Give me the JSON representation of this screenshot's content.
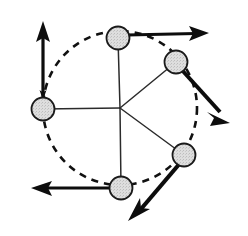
{
  "figure": {
    "type": "diagram",
    "canvas": {
      "width": 248,
      "height": 236,
      "background": "#ffffff"
    },
    "colors": {
      "stroke": "#1a1a1a",
      "spoke": "#2b2b2b",
      "node_fill": "#d9d9d9",
      "node_stroke": "#1a1a1a",
      "dashed_path": "#111111",
      "arrow": "#0d0d0d"
    },
    "center": {
      "label": "center-hub",
      "x": 120,
      "y": 108
    },
    "orbit": {
      "label": "dashed-circular-path",
      "cx": 120,
      "cy": 108,
      "r": 77,
      "dash": "7 6",
      "stroke_width": 2.6
    },
    "nodes": [
      {
        "name": "node-top",
        "x": 118,
        "y": 38,
        "r": 11.5
      },
      {
        "name": "node-upper-right",
        "x": 176,
        "y": 62,
        "r": 11.5
      },
      {
        "name": "node-lower-right",
        "x": 184,
        "y": 155,
        "r": 11.5
      },
      {
        "name": "node-bottom",
        "x": 121,
        "y": 188,
        "r": 11.5
      },
      {
        "name": "node-left",
        "x": 43,
        "y": 109,
        "r": 11.5
      }
    ],
    "spokes": [
      {
        "name": "spoke-to-top",
        "x1": 120,
        "y1": 108,
        "x2": 118,
        "y2": 38
      },
      {
        "name": "spoke-to-upper-right",
        "x1": 120,
        "y1": 108,
        "x2": 176,
        "y2": 62
      },
      {
        "name": "spoke-to-lower-right",
        "x1": 120,
        "y1": 108,
        "x2": 184,
        "y2": 155
      },
      {
        "name": "spoke-to-bottom",
        "x1": 120,
        "y1": 108,
        "x2": 121,
        "y2": 188
      },
      {
        "name": "spoke-to-left",
        "x1": 120,
        "y1": 108,
        "x2": 43,
        "y2": 109
      }
    ],
    "vectors": [
      {
        "name": "vector-top-right",
        "from_node": "node-top",
        "x1": 127,
        "y1": 35,
        "x2": 209,
        "y2": 33,
        "direction": "right",
        "stroke_width": 3.4
      },
      {
        "name": "vector-upper-right-down",
        "from_node": "node-upper-right",
        "x1": 182,
        "y1": 70,
        "x2": 229,
        "y2": 122,
        "direction": "down-right",
        "stroke_width": 4.0
      },
      {
        "name": "vector-lower-right-down-left",
        "from_node": "node-lower-right",
        "x1": 180,
        "y1": 163,
        "x2": 132,
        "y2": 219,
        "direction": "down-left",
        "stroke_width": 4.0
      },
      {
        "name": "vector-bottom-left",
        "from_node": "node-bottom",
        "x1": 113,
        "y1": 188,
        "x2": 32,
        "y2": 188,
        "direction": "left",
        "stroke_width": 3.4
      },
      {
        "name": "vector-left-up",
        "from_node": "node-left",
        "x1": 43,
        "y1": 101,
        "x2": 43,
        "y2": 22,
        "direction": "up",
        "stroke_width": 3.4
      }
    ],
    "arrowhead_into_left_node": {
      "name": "arrowhead-down-into-left-node",
      "x": 43,
      "y": 98,
      "size": 6
    }
  }
}
